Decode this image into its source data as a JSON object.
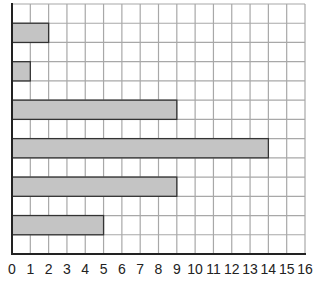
{
  "chart_data": {
    "type": "bar",
    "orientation": "horizontal",
    "title": "",
    "xlabel": "",
    "ylabel": "",
    "xlim": [
      0,
      16
    ],
    "x_ticks": [
      "0",
      "1",
      "2",
      "3",
      "4",
      "5",
      "6",
      "7",
      "8",
      "9",
      "10",
      "11",
      "12",
      "13",
      "14",
      "15",
      "16"
    ],
    "grid": true,
    "grid_rows": 13,
    "categories": [
      "bar-1",
      "bar-2",
      "bar-3",
      "bar-4",
      "bar-5",
      "bar-6"
    ],
    "values": [
      2,
      1,
      9,
      14,
      9,
      5
    ],
    "bar_row_index": [
      1,
      3,
      5,
      7,
      9,
      11
    ],
    "legend": null
  },
  "colors": {
    "bar_fill": "#c4c4c4",
    "bar_stroke": "#333333",
    "grid": "#a8a8a8",
    "axis": "#222222"
  }
}
